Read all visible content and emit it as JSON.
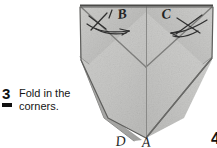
{
  "step": {
    "number": "3",
    "instruction": "Fold in the corners.",
    "bullet_icon": "square-bullet-icon"
  },
  "next_step": {
    "number": "4"
  },
  "diagram": {
    "alt": "folded-paper-fold-in-corners-diagram",
    "labels": [
      {
        "id": "label-b",
        "text": "B",
        "x": 44,
        "y": 16
      },
      {
        "id": "label-c",
        "text": "C",
        "x": 88,
        "y": 15
      },
      {
        "id": "label-d",
        "text": "D",
        "x": 42,
        "y": 142
      },
      {
        "id": "label-a",
        "text": "A",
        "x": 67,
        "y": 143
      }
    ],
    "colors": {
      "background": "#ffffff",
      "paper_light": "#d8d8d6",
      "paper_mid": "#c8c8c6",
      "paper_dark": "#b4b4b2",
      "paper_shadow": "#a2a29f",
      "ink": "#3a3a3a",
      "crease": "#8a8a88"
    },
    "annotations": [
      {
        "id": "arrow-fold-left",
        "direction": "down-right",
        "meaning": "fold left corner inward"
      },
      {
        "id": "arrow-fold-right",
        "direction": "down-left",
        "meaning": "fold right corner inward"
      },
      {
        "id": "cross-mark-left",
        "meaning": "crossing guide mark left"
      },
      {
        "id": "cross-mark-right",
        "meaning": "crossing guide mark right"
      }
    ]
  }
}
